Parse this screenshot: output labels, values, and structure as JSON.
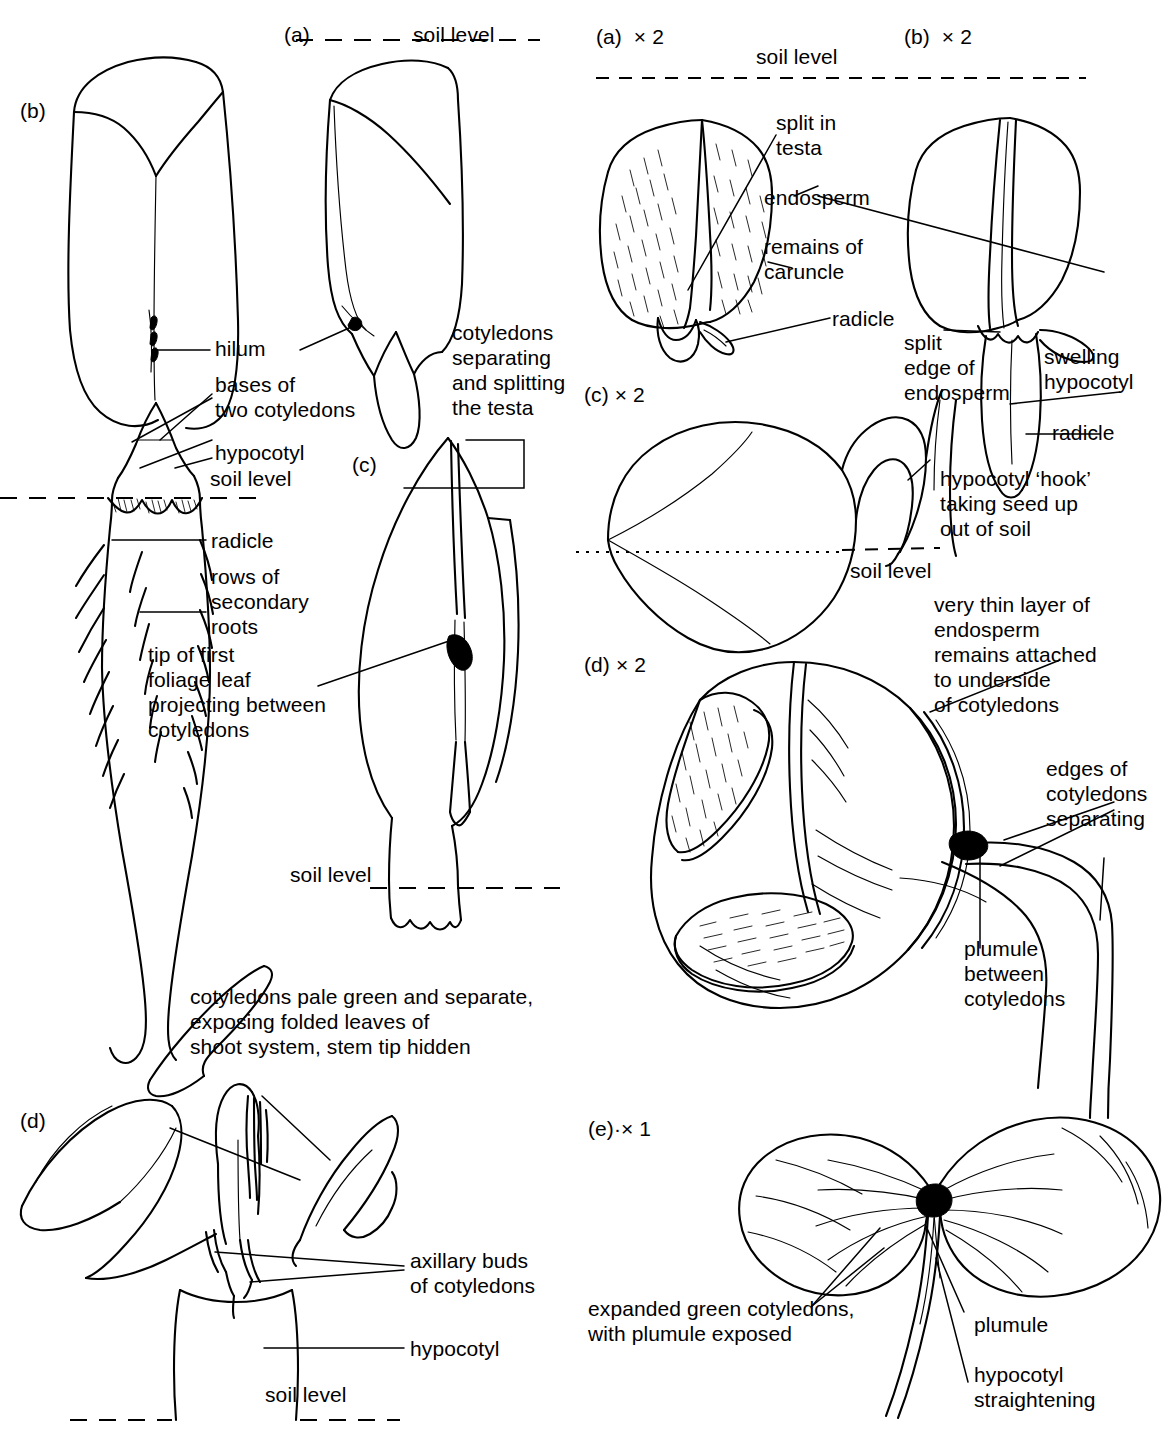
{
  "figure": {
    "type": "botanical-line-diagram",
    "background_color": "#ffffff",
    "ink_color": "#000000"
  },
  "left_panel": {
    "panel_labels": [
      {
        "id": "left-b",
        "text": "(b)"
      },
      {
        "id": "left-a",
        "text": "(a)"
      },
      {
        "id": "left-c",
        "text": "(c)"
      },
      {
        "id": "left-d",
        "text": "(d)"
      }
    ],
    "soil_level_labels": [
      {
        "id": "left-soil-top",
        "text": "soil level"
      },
      {
        "id": "left-soil-b",
        "text": "soil level"
      },
      {
        "id": "left-soil-c",
        "text": "soil level"
      },
      {
        "id": "left-soil-d",
        "text": "soil level"
      }
    ],
    "annotations": {
      "hilum": "hilum",
      "bases_of_two_cotyledons": "bases of\ntwo cotyledons",
      "hypocotyl": "hypocotyl",
      "radicle": "radicle",
      "rows_of_secondary_roots": "rows of\nsecondary\nroots",
      "tip_of_first_foliage_leaf": "tip of first\nfoliage leaf\nprojecting between\ncotyledons",
      "cotyledons_separating": "cotyledons\nseparating\nand splitting\nthe testa",
      "cotyledons_pale_green": "cotyledons pale green and separate,\nexposing folded leaves of\nshoot system, stem tip hidden",
      "axillary_buds": "axillary buds\nof cotyledons",
      "hypocotyl_d": "hypocotyl"
    }
  },
  "right_panel": {
    "panel_labels": [
      {
        "id": "right-a",
        "text": "(a)",
        "magnification": "× 2"
      },
      {
        "id": "right-b",
        "text": "(b)",
        "magnification": "× 2"
      },
      {
        "id": "right-c",
        "text": "(c)",
        "magnification": "× 2"
      },
      {
        "id": "right-d",
        "text": "(d)",
        "magnification": "× 2"
      },
      {
        "id": "right-e",
        "text": "(e)·",
        "magnification": "× 1"
      }
    ],
    "soil_level_labels": [
      {
        "id": "right-soil-top",
        "text": "soil level"
      },
      {
        "id": "right-soil-c",
        "text": "soil level"
      }
    ],
    "annotations": {
      "split_in_testa": "split in\ntesta",
      "endosperm": "endosperm",
      "remains_of_caruncle": "remains of\ncaruncle",
      "radicle_a": "radicle",
      "split_edge_of_endosperm": "split\nedge of\nendosperm",
      "swelling_hypocotyl": "swelling\nhypocotyl",
      "radicle_b": "radicle",
      "hypocotyl_hook": "hypocotyl ‘hook’\ntaking seed up\nout of soil",
      "very_thin_layer": "very thin layer of\nendosperm\nremains attached\nto underside\nof cotyledons",
      "edges_of_cotyledons_separating": "edges of\ncotyledons\nseparating",
      "plumule_between_cotyledons": "plumule\nbetween\ncotyledons",
      "expanded_green_cotyledons": "expanded green cotyledons,\nwith plumule exposed",
      "plumule": "plumule",
      "hypocotyl_straightening": "hypocotyl\nstraightening"
    }
  }
}
